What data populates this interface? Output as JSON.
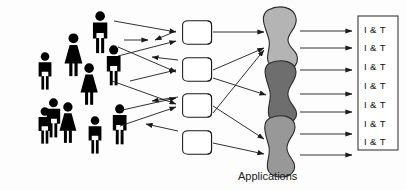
{
  "diagram": {
    "background_color": "#fdfdfd",
    "people": {
      "label": "users",
      "count": 10,
      "color": "#000000",
      "figures": [
        {
          "id": "person-1",
          "gender": "male",
          "x": 36,
          "y": 107,
          "scale": 0.8
        },
        {
          "id": "person-2",
          "gender": "female",
          "x": 58,
          "y": 102,
          "scale": 0.9
        },
        {
          "id": "person-3",
          "gender": "male",
          "x": 80,
          "y": 112,
          "scale": 0.82
        },
        {
          "id": "person-4",
          "gender": "male",
          "x": 104,
          "y": 104,
          "scale": 0.88
        },
        {
          "id": "person-5",
          "gender": "male",
          "x": 40,
          "y": 52,
          "scale": 0.82
        },
        {
          "id": "person-6",
          "gender": "female",
          "x": 66,
          "y": 36,
          "scale": 0.95
        },
        {
          "id": "person-7",
          "gender": "female",
          "x": 82,
          "y": 66,
          "scale": 0.92
        },
        {
          "id": "person-8",
          "gender": "male",
          "x": 93,
          "y": 14,
          "scale": 0.92
        },
        {
          "id": "person-9",
          "gender": "male",
          "x": 105,
          "y": 50,
          "scale": 0.88
        },
        {
          "id": "person-10",
          "gender": "male",
          "x": 78,
          "y": 110,
          "scale": 0.84
        }
      ]
    },
    "funnels": {
      "label": "funnels",
      "count": 4,
      "fill": "#ffffff",
      "stroke": "#1a1a1a",
      "items": [
        {
          "id": "funnel-1",
          "x": 180,
          "y": 20
        },
        {
          "id": "funnel-2",
          "x": 180,
          "y": 58
        },
        {
          "id": "funnel-3",
          "x": 180,
          "y": 94
        },
        {
          "id": "funnel-4",
          "x": 180,
          "y": 131
        }
      ]
    },
    "applications": {
      "label": "Applications",
      "count": 3,
      "stroke": "#2b2b2b",
      "blobs": [
        {
          "id": "application-1",
          "fill": "#b4b4b4",
          "x": 262,
          "y": 8
        },
        {
          "id": "application-2",
          "fill": "#6e6e6e",
          "x": 262,
          "y": 63
        },
        {
          "id": "application-3",
          "fill": "#989898",
          "x": 262,
          "y": 116
        }
      ]
    },
    "it_box": {
      "label": "I & T",
      "count": 7,
      "stroke": "#4a4a4a",
      "fill": "#ffffff",
      "rows": [
        "I & T",
        "I & T",
        "I & T",
        "I & T",
        "I & T",
        "I & T",
        "I & T"
      ]
    },
    "arrows": {
      "color": "#1a1a1a",
      "people_to_funnels": 12,
      "funnels_to_applications": 7,
      "applications_to_it": 7
    }
  }
}
